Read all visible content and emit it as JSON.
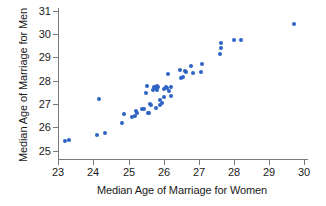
{
  "chart_data": {
    "type": "scatter",
    "title": "",
    "xlabel": "Median Age of Marriage for Women",
    "ylabel": "Median Age of Marriage for Men",
    "xlim": [
      22.6,
      30.3
    ],
    "ylim": [
      24.8,
      31.3
    ],
    "xticks": [
      23,
      24,
      25,
      26,
      27,
      28,
      29,
      30
    ],
    "yticks": [
      25,
      26,
      27,
      28,
      29,
      30,
      31
    ],
    "xtick_labels": [
      "23",
      "24",
      "25",
      "26",
      "27",
      "28",
      "29",
      "30"
    ],
    "ytick_labels": [
      "25",
      "26",
      "27",
      "28",
      "29",
      "30",
      "31"
    ],
    "grid": false,
    "legend": null,
    "marker_color": "#2f63c4",
    "marker_size_px": 4,
    "point_count": 51,
    "points": [
      {
        "x": 23.18,
        "y": 25.4
      },
      {
        "x": 23.3,
        "y": 25.45
      },
      {
        "x": 24.1,
        "y": 25.68
      },
      {
        "x": 24.15,
        "y": 27.2
      },
      {
        "x": 24.32,
        "y": 25.78
      },
      {
        "x": 24.82,
        "y": 26.18
      },
      {
        "x": 24.87,
        "y": 26.58
      },
      {
        "x": 25.1,
        "y": 26.45
      },
      {
        "x": 25.18,
        "y": 26.5
      },
      {
        "x": 25.22,
        "y": 26.72
      },
      {
        "x": 25.25,
        "y": 26.62
      },
      {
        "x": 25.38,
        "y": 26.78
      },
      {
        "x": 25.45,
        "y": 26.78
      },
      {
        "x": 25.5,
        "y": 27.47
      },
      {
        "x": 25.52,
        "y": 27.78
      },
      {
        "x": 25.55,
        "y": 26.6
      },
      {
        "x": 25.58,
        "y": 26.62
      },
      {
        "x": 25.62,
        "y": 27.0
      },
      {
        "x": 25.65,
        "y": 26.95
      },
      {
        "x": 25.68,
        "y": 27.62
      },
      {
        "x": 25.72,
        "y": 27.72
      },
      {
        "x": 25.75,
        "y": 27.68
      },
      {
        "x": 25.78,
        "y": 26.85
      },
      {
        "x": 25.8,
        "y": 27.78
      },
      {
        "x": 25.82,
        "y": 27.6
      },
      {
        "x": 25.85,
        "y": 27.72
      },
      {
        "x": 25.88,
        "y": 27.18
      },
      {
        "x": 25.9,
        "y": 26.98
      },
      {
        "x": 25.95,
        "y": 27.05
      },
      {
        "x": 26.0,
        "y": 27.3
      },
      {
        "x": 26.02,
        "y": 27.65
      },
      {
        "x": 26.05,
        "y": 27.72
      },
      {
        "x": 26.1,
        "y": 27.7
      },
      {
        "x": 26.12,
        "y": 28.28
      },
      {
        "x": 26.15,
        "y": 27.55
      },
      {
        "x": 26.2,
        "y": 27.72
      },
      {
        "x": 26.22,
        "y": 27.35
      },
      {
        "x": 26.45,
        "y": 28.48
      },
      {
        "x": 26.5,
        "y": 28.1
      },
      {
        "x": 26.55,
        "y": 28.18
      },
      {
        "x": 26.6,
        "y": 28.4
      },
      {
        "x": 26.62,
        "y": 28.38
      },
      {
        "x": 26.78,
        "y": 28.62
      },
      {
        "x": 26.82,
        "y": 28.35
      },
      {
        "x": 27.05,
        "y": 28.38
      },
      {
        "x": 27.1,
        "y": 28.72
      },
      {
        "x": 27.6,
        "y": 29.15
      },
      {
        "x": 27.62,
        "y": 29.42
      },
      {
        "x": 27.63,
        "y": 29.62
      },
      {
        "x": 28.0,
        "y": 29.75
      },
      {
        "x": 28.2,
        "y": 29.75
      },
      {
        "x": 29.7,
        "y": 30.45
      }
    ]
  }
}
